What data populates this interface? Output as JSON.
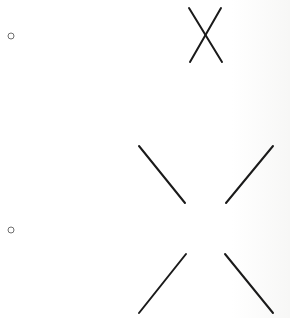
{
  "diagram": {
    "background": "#ffffff",
    "stroke_color": "#1a1a1a",
    "marker_color": "#6e6e6e",
    "markers": [
      {
        "id": "marker-1",
        "shape": "circle",
        "cx": 11,
        "cy": 36,
        "r": 3
      },
      {
        "id": "marker-2",
        "shape": "circle",
        "cx": 11,
        "cy": 230,
        "r": 3
      }
    ],
    "figures": [
      {
        "id": "crossed-x",
        "description": "X formed by two crossing lines",
        "segments": [
          {
            "x1": 189,
            "y1": 8,
            "x2": 222,
            "y2": 62
          },
          {
            "x1": 221,
            "y1": 8,
            "x2": 190,
            "y2": 62
          }
        ]
      },
      {
        "id": "split-x",
        "description": "X with center gap (four separate segments)",
        "segments": [
          {
            "x1": 139,
            "y1": 146,
            "x2": 185,
            "y2": 203
          },
          {
            "x1": 273,
            "y1": 146,
            "x2": 226,
            "y2": 203
          },
          {
            "x1": 186,
            "y1": 254,
            "x2": 139,
            "y2": 313
          },
          {
            "x1": 225,
            "y1": 254,
            "x2": 273,
            "y2": 313
          }
        ]
      }
    ]
  }
}
